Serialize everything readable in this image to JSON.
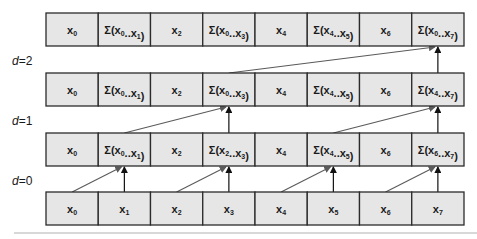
{
  "diagram": {
    "levels": [
      {
        "label_var": "d",
        "label_eq": "=0"
      },
      {
        "label_var": "d",
        "label_eq": "=1"
      },
      {
        "label_var": "d",
        "label_eq": "=2"
      }
    ],
    "rows": [
      {
        "name": "result-after-d2",
        "cells": [
          {
            "main": "x",
            "sub": "0"
          },
          {
            "main": "Σ(x",
            "sub": "0",
            "mid": "..x",
            "sub2": "1",
            "end": ")"
          },
          {
            "main": "x",
            "sub": "2"
          },
          {
            "main": "Σ(x",
            "sub": "0",
            "mid": "..x",
            "sub2": "3",
            "end": ")"
          },
          {
            "main": "x",
            "sub": "4"
          },
          {
            "main": "Σ(x",
            "sub": "4",
            "mid": "..x",
            "sub2": "5",
            "end": ")"
          },
          {
            "main": "x",
            "sub": "6"
          },
          {
            "main": "Σ(x",
            "sub": "0",
            "mid": "..x",
            "sub2": "7",
            "end": ")"
          }
        ]
      },
      {
        "name": "result-after-d1",
        "cells": [
          {
            "main": "x",
            "sub": "0"
          },
          {
            "main": "Σ(x",
            "sub": "0",
            "mid": "..x",
            "sub2": "1",
            "end": ")"
          },
          {
            "main": "x",
            "sub": "2"
          },
          {
            "main": "Σ(x",
            "sub": "0",
            "mid": "..x",
            "sub2": "3",
            "end": ")"
          },
          {
            "main": "x",
            "sub": "4"
          },
          {
            "main": "Σ(x",
            "sub": "4",
            "mid": "..x",
            "sub2": "5",
            "end": ")"
          },
          {
            "main": "x",
            "sub": "6"
          },
          {
            "main": "Σ(x",
            "sub": "4",
            "mid": "..x",
            "sub2": "7",
            "end": ")"
          }
        ]
      },
      {
        "name": "result-after-d0",
        "cells": [
          {
            "main": "x",
            "sub": "0"
          },
          {
            "main": "Σ(x",
            "sub": "0",
            "mid": "..x",
            "sub2": "1",
            "end": ")"
          },
          {
            "main": "x",
            "sub": "2"
          },
          {
            "main": "Σ(x",
            "sub": "2",
            "mid": "..x",
            "sub2": "3",
            "end": ")"
          },
          {
            "main": "x",
            "sub": "4"
          },
          {
            "main": "Σ(x",
            "sub": "4",
            "mid": "..x",
            "sub2": "5",
            "end": ")"
          },
          {
            "main": "x",
            "sub": "6"
          },
          {
            "main": "Σ(x",
            "sub": "6",
            "mid": "..x",
            "sub2": "7",
            "end": ")"
          }
        ]
      },
      {
        "name": "input",
        "cells": [
          {
            "main": "x",
            "sub": "0"
          },
          {
            "main": "x",
            "sub": "1"
          },
          {
            "main": "x",
            "sub": "2"
          },
          {
            "main": "x",
            "sub": "3"
          },
          {
            "main": "x",
            "sub": "4"
          },
          {
            "main": "x",
            "sub": "5"
          },
          {
            "main": "x",
            "sub": "6"
          },
          {
            "main": "x",
            "sub": "7"
          }
        ]
      }
    ],
    "edges": [
      {
        "from_row": 3,
        "to_row": 2,
        "pairs": [
          [
            0,
            1
          ],
          [
            2,
            3
          ],
          [
            4,
            5
          ],
          [
            6,
            7
          ]
        ]
      },
      {
        "from_row": 2,
        "to_row": 1,
        "pairs": [
          [
            1,
            3
          ],
          [
            5,
            7
          ]
        ]
      },
      {
        "from_row": 1,
        "to_row": 0,
        "pairs": [
          [
            3,
            7
          ]
        ]
      }
    ]
  }
}
